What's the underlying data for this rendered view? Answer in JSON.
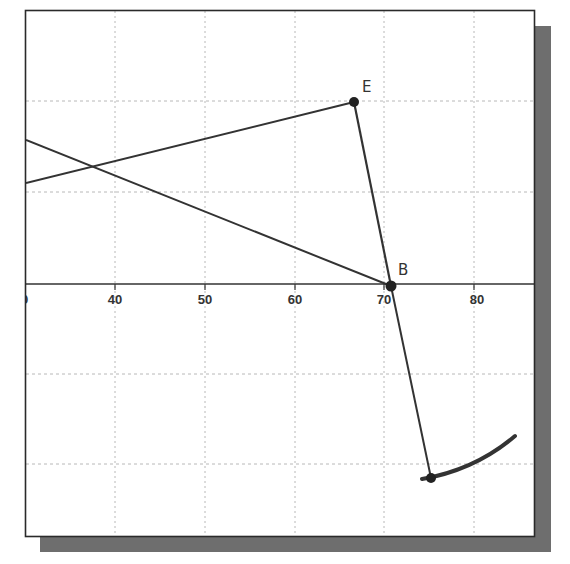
{
  "diagram": {
    "type": "geometric-construction-on-grid",
    "colors": {
      "background": "#ffffff",
      "frame": "#2a2a2a",
      "shadow": "#6e6e6e",
      "grid": "#b8b8b8",
      "lines": "#333333",
      "points": "#222222"
    },
    "x_axis": {
      "tick_labels": [
        "30",
        "40",
        "50",
        "60",
        "70",
        "80"
      ],
      "visible_left_label_fragment": "0",
      "grid": "dotted"
    },
    "points": [
      {
        "label": "E",
        "x_approx": 66,
        "y_units_above_axis": 20
      },
      {
        "label": "B",
        "x_approx": 70.5,
        "y_units_above_axis": 0
      },
      {
        "label": "",
        "x_approx": 75,
        "y_units_below_axis": 21.5
      }
    ],
    "labels": {
      "E": "E",
      "B": "B",
      "tick_0": "0",
      "tick_40": "40",
      "tick_50": "50",
      "tick_60": "60",
      "tick_70": "70",
      "tick_80": "80"
    }
  }
}
